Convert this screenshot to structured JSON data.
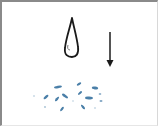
{
  "figure": {
    "colors": {
      "frame": "#8a8a8a",
      "ink": "#1a1a1a",
      "splash": "#4a7fa8",
      "background": "#ffffff"
    },
    "elements": [
      {
        "name": "droplet",
        "icon": "water-drop-icon"
      },
      {
        "name": "arrow",
        "icon": "arrow-down-icon",
        "direction": "down"
      },
      {
        "name": "splash",
        "icon": "splash-icon",
        "particle_count": 14
      }
    ]
  }
}
